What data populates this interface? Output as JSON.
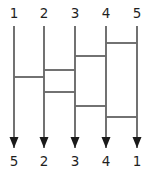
{
  "figure": {
    "kind": "wiring-diagram",
    "title": "",
    "background_color": "#ffffff",
    "wire_color": "#6b6b6b",
    "arrow_color": "#1a1a1a",
    "label_color": "#1f1f1f",
    "width": 150,
    "height": 172
  },
  "chart_data": {
    "type": "diagram",
    "title": "",
    "xlabel": "",
    "ylabel": "",
    "grid": false,
    "legend": null,
    "top_labels": [
      "1",
      "2",
      "3",
      "4",
      "5"
    ],
    "bottom_labels": [
      "5",
      "2",
      "3",
      "4",
      "1"
    ],
    "wire_count": 5,
    "wire_x": [
      14,
      44,
      75,
      106,
      137
    ],
    "wire_top_y": 26,
    "wire_bottom_y": 148,
    "crossings": [
      {
        "index": 1,
        "left_wire": 4,
        "right_wire": 5,
        "y": 43
      },
      {
        "index": 2,
        "left_wire": 3,
        "right_wire": 4,
        "y": 56
      },
      {
        "index": 3,
        "left_wire": 2,
        "right_wire": 3,
        "y": 70
      },
      {
        "index": 4,
        "left_wire": 1,
        "right_wire": 2,
        "y": 77
      },
      {
        "index": 5,
        "left_wire": 2,
        "right_wire": 3,
        "y": 92
      },
      {
        "index": 6,
        "left_wire": 3,
        "right_wire": 4,
        "y": 106
      },
      {
        "index": 7,
        "left_wire": 4,
        "right_wire": 5,
        "y": 117
      }
    ],
    "top_label_y": 18,
    "bottom_label_y": 166,
    "arrow_tip_y": 148,
    "arrow_width": 9,
    "arrow_height": 11
  }
}
